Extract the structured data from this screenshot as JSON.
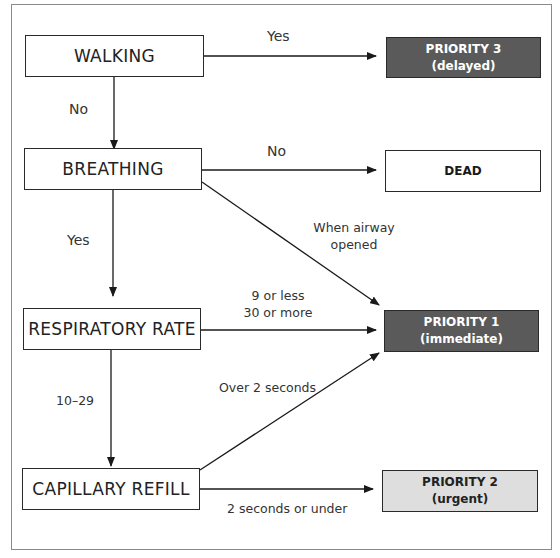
{
  "diagram": {
    "type": "triage-flowchart",
    "nodes": {
      "walking": {
        "label": "WALKING"
      },
      "breathing": {
        "label": "BREATHING"
      },
      "respiratory_rate": {
        "label": "RESPIRATORY RATE"
      },
      "capillary_refill": {
        "label": "CAPILLARY REFILL"
      },
      "priority3": {
        "title": "PRIORITY 3",
        "subtitle": "(delayed)",
        "fill": "#5a5a5a"
      },
      "dead": {
        "title": "DEAD",
        "fill": "#ffffff"
      },
      "priority1": {
        "title": "PRIORITY 1",
        "subtitle": "(immediate)",
        "fill": "#5a5a5a"
      },
      "priority2": {
        "title": "PRIORITY 2",
        "subtitle": "(urgent)",
        "fill": "#dedede"
      }
    },
    "edges": {
      "walking_yes": {
        "from": "WALKING",
        "to": "PRIORITY 3",
        "label": "Yes"
      },
      "walking_no": {
        "from": "WALKING",
        "to": "BREATHING",
        "label": "No"
      },
      "breathing_no": {
        "from": "BREATHING",
        "to": "DEAD",
        "label": "No"
      },
      "breathing_airway": {
        "from": "BREATHING",
        "to": "PRIORITY 1",
        "label_line1": "When airway",
        "label_line2": "opened"
      },
      "breathing_yes": {
        "from": "BREATHING",
        "to": "RESPIRATORY RATE",
        "label": "Yes"
      },
      "rr_extreme": {
        "from": "RESPIRATORY RATE",
        "to": "PRIORITY 1",
        "label_line1": "9 or less",
        "label_line2": "30 or more"
      },
      "rr_normal": {
        "from": "RESPIRATORY RATE",
        "to": "CAPILLARY REFILL",
        "label": "10–29"
      },
      "cr_over": {
        "from": "CAPILLARY REFILL",
        "to": "PRIORITY 1",
        "label": "Over 2 seconds"
      },
      "cr_under": {
        "from": "CAPILLARY REFILL",
        "to": "PRIORITY 2",
        "label": "2 seconds or under"
      }
    }
  }
}
